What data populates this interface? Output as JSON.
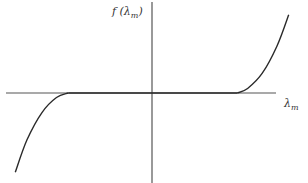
{
  "chart_data": {
    "type": "line",
    "title": "",
    "xlabel": "λ",
    "xlabel_subscript": "m",
    "ylabel_prefix": "f (λ",
    "ylabel_subscript": "m",
    "ylabel_suffix": ")",
    "grid": false,
    "legend": "none",
    "xlim": [
      -1.0,
      1.0
    ],
    "ylim": [
      -1.0,
      1.0
    ],
    "series": [
      {
        "name": "f(λm)",
        "flat_interval": [
          -0.57,
          0.58
        ],
        "x": [
          -0.93,
          -0.85,
          -0.75,
          -0.65,
          -0.57,
          0.0,
          0.58,
          0.65,
          0.75,
          0.85,
          0.93
        ],
        "y": [
          -0.88,
          -0.52,
          -0.22,
          -0.05,
          0.0,
          0.0,
          0.0,
          0.05,
          0.22,
          0.52,
          0.87
        ]
      }
    ]
  }
}
